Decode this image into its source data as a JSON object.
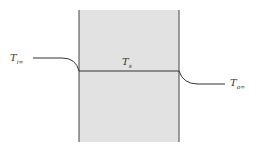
{
  "diagram": {
    "type": "temperature-profile-through-wall",
    "labels": {
      "inner_fluid_temp": {
        "main": "T",
        "sub": "i∞"
      },
      "surface_temp": {
        "main": "T",
        "sub": "s"
      },
      "outer_fluid_temp": {
        "main": "T",
        "sub": "o∞"
      }
    },
    "colors": {
      "wall_fill": "#e2e2e2",
      "lines": "#333333"
    }
  }
}
